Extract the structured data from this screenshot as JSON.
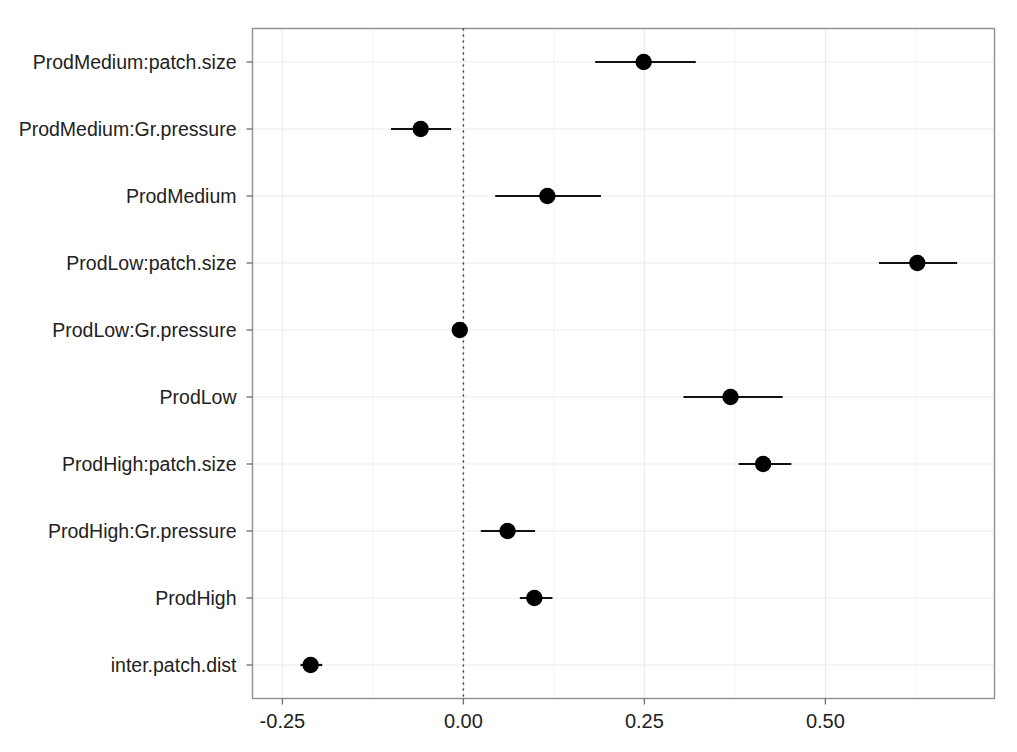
{
  "chart_data": {
    "type": "scatter",
    "title": "",
    "subtitle": "",
    "xlabel": "",
    "ylabel": "",
    "xlim": [
      -0.2913,
      0.7336
    ],
    "grid": true,
    "legend": null,
    "xticks": [
      -0.25,
      0.0,
      0.25,
      0.5
    ],
    "xticklabels": [
      "-0.25",
      "0.00",
      "0.25",
      "0.50"
    ],
    "reference_line": {
      "x": 0.0,
      "style": "dotted"
    },
    "categories": [
      "ProdMedium:patch.size",
      "ProdMedium:Gr.pressure",
      "ProdMedium",
      "ProdLow:patch.size",
      "ProdLow:Gr.pressure",
      "ProdLow",
      "ProdHigh:patch.size",
      "ProdHigh:Gr.pressure",
      "ProdHigh",
      "inter.patch.dist"
    ],
    "values": [
      0.249,
      -0.059,
      0.116,
      0.627,
      -0.005,
      0.369,
      0.414,
      0.061,
      0.098,
      -0.211
    ],
    "ci_low": [
      0.182,
      -0.1,
      0.044,
      0.574,
      -0.012,
      0.304,
      0.38,
      0.024,
      0.078,
      -0.225
    ],
    "ci_high": [
      0.321,
      -0.017,
      0.19,
      0.682,
      0.002,
      0.441,
      0.453,
      0.099,
      0.123,
      -0.195
    ],
    "points": [
      {
        "label": "ProdMedium:patch.size",
        "estimate": 0.249,
        "ci_low": 0.182,
        "ci_high": 0.321
      },
      {
        "label": "ProdMedium:Gr.pressure",
        "estimate": -0.059,
        "ci_low": -0.1,
        "ci_high": -0.017
      },
      {
        "label": "ProdMedium",
        "estimate": 0.116,
        "ci_low": 0.044,
        "ci_high": 0.19
      },
      {
        "label": "ProdLow:patch.size",
        "estimate": 0.627,
        "ci_low": 0.574,
        "ci_high": 0.682
      },
      {
        "label": "ProdLow:Gr.pressure",
        "estimate": -0.005,
        "ci_low": -0.012,
        "ci_high": 0.002
      },
      {
        "label": "ProdLow",
        "estimate": 0.369,
        "ci_low": 0.304,
        "ci_high": 0.441
      },
      {
        "label": "ProdHigh:patch.size",
        "estimate": 0.414,
        "ci_low": 0.38,
        "ci_high": 0.453
      },
      {
        "label": "ProdHigh:Gr.pressure",
        "estimate": 0.061,
        "ci_low": 0.024,
        "ci_high": 0.099
      },
      {
        "label": "ProdHigh",
        "estimate": 0.098,
        "ci_low": 0.078,
        "ci_high": 0.123
      },
      {
        "label": "inter.patch.dist",
        "estimate": -0.211,
        "ci_low": -0.225,
        "ci_high": -0.195
      }
    ],
    "colors": {
      "point": "#000000",
      "whisker": "#111111",
      "grid": "#ebebeb",
      "panel_border": "#8f8f8f",
      "reference_line": "#3a3a3a",
      "background": "#ffffff",
      "text": "#222222"
    }
  }
}
